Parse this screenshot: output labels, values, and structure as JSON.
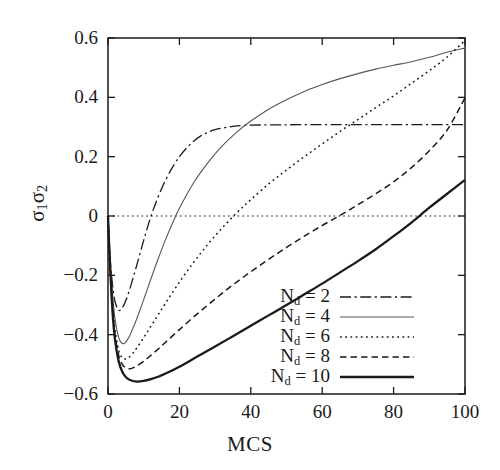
{
  "chart_data": {
    "type": "line",
    "title": "",
    "xlabel": "MCS",
    "ylabel": "σ1σ2",
    "ylabel_base": "σ",
    "xlim": [
      0,
      100
    ],
    "ylim": [
      -0.6,
      0.6
    ],
    "xticks": [
      "0",
      "20",
      "40",
      "60",
      "80",
      "100"
    ],
    "xtick_values": [
      0,
      20,
      40,
      60,
      80,
      100
    ],
    "yticks": [
      "0.6",
      "0.4",
      "0.2",
      "0",
      "−0.2",
      "−0.4",
      "−0.6"
    ],
    "ytick_values": [
      0.6,
      0.4,
      0.2,
      0,
      -0.2,
      -0.4,
      -0.6
    ],
    "grid": false,
    "zero_line": true,
    "legend_position": "lower-right-inside",
    "series": [
      {
        "name": "N_d = 2",
        "label": "N",
        "sub": "d",
        "suffix": " = 2",
        "style": "dashdot",
        "color": "#1a1a1a",
        "width": 1.3,
        "x": [
          0,
          0.5,
          1,
          1.5,
          2,
          3,
          4,
          5,
          6,
          7,
          8,
          9,
          10,
          12,
          14,
          16,
          18,
          20,
          22,
          24,
          26,
          28,
          30,
          35,
          40,
          50,
          60,
          70,
          80,
          90,
          100
        ],
        "y": [
          0,
          -0.12,
          -0.2,
          -0.255,
          -0.29,
          -0.318,
          -0.31,
          -0.285,
          -0.25,
          -0.21,
          -0.168,
          -0.125,
          -0.082,
          -0.002,
          0.063,
          0.118,
          0.163,
          0.2,
          0.229,
          0.252,
          0.27,
          0.282,
          0.291,
          0.302,
          0.306,
          0.3075,
          0.308,
          0.308,
          0.308,
          0.308,
          0.308
        ]
      },
      {
        "name": "N_d = 4",
        "label": "N",
        "sub": "d",
        "suffix": " = 4",
        "style": "solid-thin",
        "color": "#555555",
        "width": 1.1,
        "x": [
          0,
          0.5,
          1,
          1.5,
          2,
          3,
          4,
          5,
          6,
          7,
          8,
          10,
          12,
          14,
          16,
          18,
          20,
          24,
          28,
          32,
          36,
          40,
          45,
          50,
          55,
          60,
          65,
          70,
          75,
          80,
          85,
          90,
          95,
          100
        ],
        "y": [
          0,
          -0.13,
          -0.225,
          -0.295,
          -0.35,
          -0.41,
          -0.43,
          -0.425,
          -0.405,
          -0.378,
          -0.348,
          -0.282,
          -0.213,
          -0.146,
          -0.083,
          -0.026,
          0.026,
          0.112,
          0.18,
          0.236,
          0.282,
          0.32,
          0.36,
          0.392,
          0.42,
          0.443,
          0.463,
          0.48,
          0.495,
          0.508,
          0.52,
          0.535,
          0.552,
          0.566
        ]
      },
      {
        "name": "N_d = 6",
        "label": "N",
        "sub": "d",
        "suffix": " = 6",
        "style": "dotted",
        "color": "#1a1a1a",
        "width": 1.5,
        "x": [
          0,
          0.5,
          1,
          1.5,
          2,
          3,
          4,
          5,
          6,
          7,
          8,
          10,
          12,
          14,
          16,
          20,
          24,
          28,
          32,
          36,
          40,
          45,
          50,
          55,
          60,
          65,
          70,
          75,
          80,
          85,
          90,
          95,
          100
        ],
        "y": [
          0,
          -0.14,
          -0.245,
          -0.325,
          -0.385,
          -0.452,
          -0.478,
          -0.482,
          -0.475,
          -0.462,
          -0.446,
          -0.41,
          -0.372,
          -0.334,
          -0.296,
          -0.223,
          -0.156,
          -0.095,
          -0.04,
          0.01,
          0.055,
          0.108,
          0.155,
          0.2,
          0.243,
          0.285,
          0.325,
          0.365,
          0.405,
          0.447,
          0.49,
          0.536,
          0.592
        ]
      },
      {
        "name": "N_d = 8",
        "label": "N",
        "sub": "d",
        "suffix": " = 8",
        "style": "dashed",
        "color": "#1a1a1a",
        "width": 1.5,
        "x": [
          0,
          0.5,
          1,
          1.5,
          2,
          3,
          4,
          5,
          6,
          7,
          8,
          10,
          12,
          14,
          16,
          20,
          25,
          30,
          35,
          40,
          45,
          50,
          55,
          60,
          65,
          70,
          75,
          80,
          85,
          90,
          95,
          100
        ],
        "y": [
          0,
          -0.145,
          -0.26,
          -0.345,
          -0.405,
          -0.47,
          -0.5,
          -0.512,
          -0.515,
          -0.512,
          -0.506,
          -0.49,
          -0.47,
          -0.449,
          -0.427,
          -0.383,
          -0.33,
          -0.28,
          -0.232,
          -0.188,
          -0.146,
          -0.106,
          -0.068,
          -0.032,
          0.002,
          0.038,
          0.075,
          0.115,
          0.163,
          0.22,
          0.29,
          0.398
        ]
      },
      {
        "name": "N_d = 10",
        "label": "N",
        "sub": "d",
        "suffix": " = 10",
        "style": "solid-thick",
        "color": "#1a1a1a",
        "width": 2.3,
        "x": [
          0,
          0.5,
          1,
          1.5,
          2,
          3,
          4,
          5,
          6,
          8,
          10,
          12,
          14,
          16,
          20,
          25,
          30,
          35,
          40,
          45,
          50,
          55,
          60,
          65,
          70,
          75,
          80,
          85,
          90,
          95,
          100
        ],
        "y": [
          0,
          -0.15,
          -0.27,
          -0.36,
          -0.42,
          -0.49,
          -0.525,
          -0.543,
          -0.552,
          -0.558,
          -0.556,
          -0.55,
          -0.542,
          -0.532,
          -0.508,
          -0.474,
          -0.44,
          -0.405,
          -0.37,
          -0.335,
          -0.3,
          -0.264,
          -0.228,
          -0.19,
          -0.152,
          -0.112,
          -0.068,
          -0.022,
          0.028,
          0.075,
          0.122
        ]
      }
    ]
  },
  "axes": {
    "x_title": "MCS"
  }
}
